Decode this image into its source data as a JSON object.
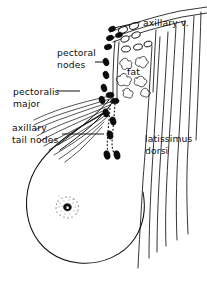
{
  "figure": {
    "ink_color": "#111111",
    "background_color": "#ffffff"
  },
  "labels": {
    "axillary_vein": "axillary v.",
    "pectoral_nodes": "pectoral\nnodes",
    "fat": "fat",
    "pectoralis_major": "pectoralis\nmajor",
    "axillary_tail_nodes": "axillary\ntail nodes",
    "latissimus_dorsi": "latissimus\ndorsi"
  },
  "structures": {
    "breast": "breast-outline",
    "nipple": "nipple",
    "areola": "stippled-areola",
    "pectoralis_major": "pectoralis-major-muscle-fibers",
    "latissimus_dorsi": "latissimus-dorsi-muscle-fibers",
    "axillary_vein": "axillary-vein",
    "axillary_fat": "axillary-fat-lobules",
    "filled_nodes": "lymph-nodes-filled",
    "open_nodes": "lymph-nodes-open",
    "lymphatic_chain": "dotted-lymphatic-chain"
  },
  "leader_lines": {
    "pectoral_nodes": "leader-pectoral-nodes",
    "pectoralis_major": "leader-pectoralis-major",
    "axillary_tail_nodes": "leader-axillary-tail-nodes",
    "axillary_vein": "leader-axillary-vein"
  }
}
